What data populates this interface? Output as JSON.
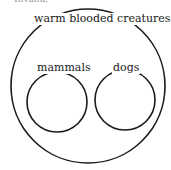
{
  "cropped_header": "Invalid.",
  "diagram": {
    "type": "euler-diagram",
    "stroke_color": "#1a1a1a",
    "sets": [
      {
        "id": "outer",
        "label": "warm blooded creatures",
        "cx": 88,
        "cy": 86,
        "r": 77
      },
      {
        "id": "left",
        "label": "mammals",
        "cx": 57,
        "cy": 102,
        "r": 30
      },
      {
        "id": "right",
        "label": "dogs",
        "cx": 125,
        "cy": 100,
        "r": 30
      }
    ]
  }
}
